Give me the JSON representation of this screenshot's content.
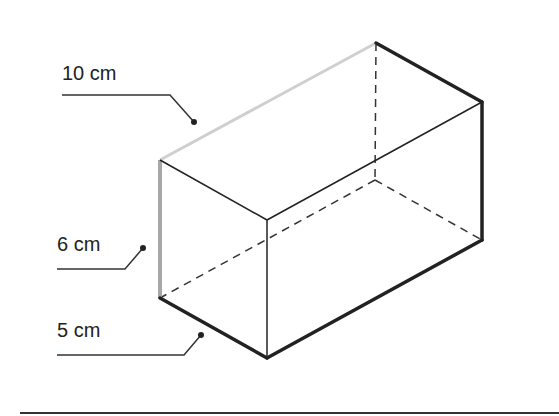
{
  "diagram": {
    "type": "rectangular-prism",
    "labels": [
      {
        "id": "length",
        "text": "10 cm",
        "x": 62,
        "y": 63
      },
      {
        "id": "height",
        "text": "6 cm",
        "x": 57,
        "y": 234
      },
      {
        "id": "width",
        "text": "5 cm",
        "x": 57,
        "y": 320
      }
    ],
    "vertices": {
      "front_top_left": [
        160,
        160
      ],
      "back_top_left": [
        376,
        43
      ],
      "back_top_right": [
        482,
        102
      ],
      "front_top_right": [
        267,
        220
      ],
      "front_bottom_right": [
        267,
        358
      ],
      "front_bottom_left": [
        160,
        298
      ],
      "back_bottom_right": [
        482,
        240
      ],
      "back_bottom_left_hidden": [
        375,
        180
      ]
    },
    "colors": {
      "edge": "#222222",
      "highlight_edge": "#c8c8c8",
      "hidden_edge": "#333333"
    }
  }
}
